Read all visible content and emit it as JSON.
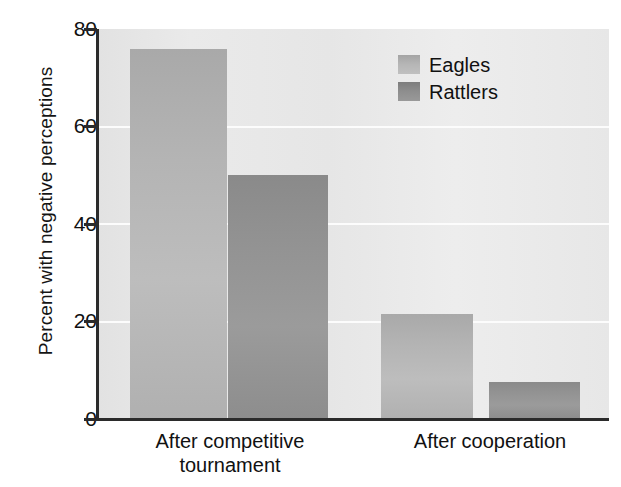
{
  "chart_data": {
    "type": "bar",
    "title": "",
    "xlabel": "",
    "ylabel": "Percent with negative perceptions",
    "categories": [
      "After competitive tournament",
      "After cooperation"
    ],
    "category_lines": [
      [
        "After competitive",
        "tournament"
      ],
      [
        "After cooperation"
      ]
    ],
    "series": [
      {
        "name": "Eagles",
        "color": "#b4b4b4",
        "values": [
          76,
          21.5
        ]
      },
      {
        "name": "Rattlers",
        "color": "#909090",
        "values": [
          50,
          7.5
        ]
      }
    ],
    "ylim": [
      0,
      80
    ],
    "yticks": [
      0,
      20,
      40,
      60,
      80
    ],
    "ytick_labels": [
      "0",
      "20",
      "40",
      "60",
      "80"
    ],
    "gridlines": [
      20,
      40,
      60
    ],
    "grid": true,
    "grid_color": "#fcfcfc",
    "plot_background": "#e7e7e7",
    "axis_color": "#2b2b2b",
    "legend_position": "top-right",
    "legend_entries": [
      "Eagles",
      "Rattlers"
    ]
  }
}
